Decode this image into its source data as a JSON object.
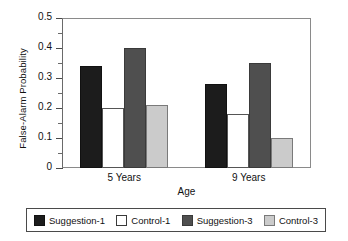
{
  "chart_data": {
    "type": "bar",
    "title": "",
    "xlabel": "Age",
    "ylabel": "False-Alarm Probability",
    "categories": [
      "5 Years",
      "9 Years"
    ],
    "series": [
      {
        "name": "Suggestion-1",
        "color": "#1c1c1c",
        "values": [
          0.34,
          0.28
        ]
      },
      {
        "name": "Control-1",
        "color": "#ffffff",
        "values": [
          0.2,
          0.18
        ]
      },
      {
        "name": "Suggestion-3",
        "color": "#4f4f4f",
        "values": [
          0.4,
          0.35
        ]
      },
      {
        "name": "Control-3",
        "color": "#cbcbcb",
        "values": [
          0.21,
          0.1
        ]
      }
    ],
    "ylim": [
      0,
      0.5
    ],
    "ytick_labels": [
      "0",
      "0.1",
      "0.2",
      "0.3",
      "0.4",
      "0.5"
    ],
    "ytick_values": [
      0,
      0.1,
      0.2,
      0.3,
      0.4,
      0.5
    ],
    "yminor_values": [
      0.05,
      0.15,
      0.25,
      0.35,
      0.45
    ],
    "grid": false,
    "legend_position": "bottom"
  }
}
